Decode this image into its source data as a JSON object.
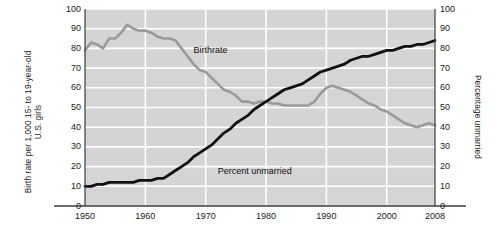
{
  "chart_data": {
    "type": "line",
    "title": "",
    "xlabel": "",
    "ylabel": "Birth rate per 1,000 15- to 19-year-old U.S. girls",
    "ylabel_right": "Percentage unmarried",
    "xlim": [
      1950,
      2008
    ],
    "ylim": [
      0,
      100
    ],
    "grid": true,
    "legend_position": "inline-annotations",
    "yticks": [
      "0",
      "10",
      "20",
      "30",
      "40",
      "50",
      "60",
      "70",
      "80",
      "90",
      "100"
    ],
    "yticks_right": [
      "0",
      "10",
      "20",
      "30",
      "40",
      "50",
      "60",
      "70",
      "80",
      "90",
      "100"
    ],
    "xticks": [
      "1950",
      "1960",
      "1970",
      "1980",
      "1990",
      "2000",
      "2008"
    ],
    "xtick_values": [
      1950,
      1960,
      1970,
      1980,
      1990,
      2000,
      2008
    ],
    "series": [
      {
        "name": "Birthrate",
        "color": "#9a9a9a",
        "label_x": 1968,
        "label_y": 79,
        "x": [
          1950,
          1951,
          1952,
          1953,
          1954,
          1955,
          1956,
          1957,
          1958,
          1959,
          1960,
          1961,
          1962,
          1963,
          1964,
          1965,
          1966,
          1967,
          1968,
          1969,
          1970,
          1971,
          1972,
          1973,
          1974,
          1975,
          1976,
          1977,
          1978,
          1979,
          1980,
          1981,
          1982,
          1983,
          1984,
          1985,
          1986,
          1987,
          1988,
          1989,
          1990,
          1991,
          1992,
          1993,
          1994,
          1995,
          1996,
          1997,
          1998,
          1999,
          2000,
          2001,
          2002,
          2003,
          2004,
          2005,
          2006,
          2007,
          2008
        ],
        "y": [
          79,
          83,
          82,
          80,
          85,
          85,
          88,
          92,
          90,
          89,
          89,
          88,
          86,
          85,
          85,
          84,
          80,
          76,
          72,
          69,
          68,
          65,
          62,
          59,
          58,
          56,
          53,
          53,
          52,
          53,
          53,
          52,
          52,
          51,
          51,
          51,
          51,
          51,
          53,
          57,
          60,
          61,
          60,
          59,
          58,
          56,
          54,
          52,
          51,
          49,
          48,
          46,
          44,
          42,
          41,
          40,
          41,
          42,
          41
        ]
      },
      {
        "name": "Percent unmarried",
        "color": "#111111",
        "label_x": 1972,
        "label_y": 18,
        "x": [
          1950,
          1951,
          1952,
          1953,
          1954,
          1955,
          1956,
          1957,
          1958,
          1959,
          1960,
          1961,
          1962,
          1963,
          1964,
          1965,
          1966,
          1967,
          1968,
          1969,
          1970,
          1971,
          1972,
          1973,
          1974,
          1975,
          1976,
          1977,
          1978,
          1979,
          1980,
          1981,
          1982,
          1983,
          1984,
          1985,
          1986,
          1987,
          1988,
          1989,
          1990,
          1991,
          1992,
          1993,
          1994,
          1995,
          1996,
          1997,
          1998,
          1999,
          2000,
          2001,
          2002,
          2003,
          2004,
          2005,
          2006,
          2007,
          2008
        ],
        "y": [
          10,
          10,
          11,
          11,
          12,
          12,
          12,
          12,
          12,
          13,
          13,
          13,
          14,
          14,
          16,
          18,
          20,
          22,
          25,
          27,
          29,
          31,
          34,
          37,
          39,
          42,
          44,
          46,
          49,
          51,
          53,
          55,
          57,
          59,
          60,
          61,
          62,
          64,
          66,
          68,
          69,
          70,
          71,
          72,
          74,
          75,
          76,
          76,
          77,
          78,
          79,
          79,
          80,
          81,
          81,
          82,
          82,
          83,
          84
        ]
      }
    ]
  },
  "chart": {
    "ylabel_left_line1": "Birth rate per 1,000 15- to 19-year-old",
    "ylabel_left_line2": "U.S. girls",
    "ylabel_right": "Percentage unmarried",
    "plot_bg_color": "#d6d6d6",
    "gridline_color": "#ffffff",
    "axis_color": "#3b3b3b"
  }
}
